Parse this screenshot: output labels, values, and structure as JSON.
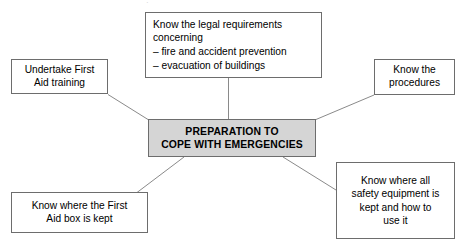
{
  "diagram": {
    "title": "PREPARATION TO COPE WITH EMERGENCIES",
    "type": "mind-map",
    "center": {
      "label": "PREPARATION TO\nCOPE WITH EMERGENCIES",
      "fill_color": "#d5d5d5",
      "border_color": "#6d6d6d",
      "text_color": "#000000"
    },
    "nodes": [
      {
        "id": "legal",
        "label": "Know the legal requirements\nconcerning\n– fire and accident prevention\n– evacuation of buildings",
        "position": "top",
        "align": "left",
        "fill_color": "#ffffff",
        "border_color": "#6d6d6d"
      },
      {
        "id": "first-aid-training",
        "label": "Undertake First\nAid training",
        "position": "top-left",
        "align": "center",
        "fill_color": "#ffffff",
        "border_color": "#6d6d6d"
      },
      {
        "id": "procedures",
        "label": "Know the\nprocedures",
        "position": "top-right",
        "align": "center",
        "fill_color": "#ffffff",
        "border_color": "#6d6d6d"
      },
      {
        "id": "first-aid-box",
        "label": "Know where the First\nAid box is kept",
        "position": "bottom-left",
        "align": "center",
        "fill_color": "#ffffff",
        "border_color": "#6d6d6d"
      },
      {
        "id": "safety-equipment",
        "label": "Know where all\nsafety equipment is\nkept and how to\nuse it",
        "position": "bottom-right",
        "align": "center",
        "fill_color": "#ffffff",
        "border_color": "#6d6d6d"
      }
    ],
    "connector_color": "#8a8a8a",
    "artifact_text": "·"
  }
}
